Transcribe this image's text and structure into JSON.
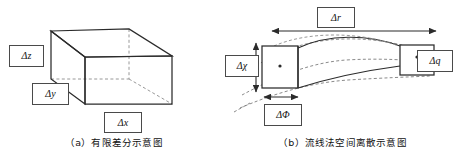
{
  "figure": {
    "panels": [
      {
        "id": "a",
        "caption": "（a）有限差分示意图",
        "diagram_type": "3d-rectangular-box",
        "labels": [
          {
            "name": "delta-z",
            "delta": "Δ",
            "symbol": "z",
            "text": "Δz"
          },
          {
            "name": "delta-y",
            "delta": "Δ",
            "symbol": "y",
            "text": "Δy"
          },
          {
            "name": "delta-x",
            "delta": "Δ",
            "symbol": "x",
            "text": "Δx"
          }
        ]
      },
      {
        "id": "b",
        "caption": "（b）流线法空间离散示意图",
        "diagram_type": "curved-streamtube-cell",
        "labels": [
          {
            "name": "delta-r",
            "delta": "Δ",
            "symbol": "r",
            "text": "Δr"
          },
          {
            "name": "delta-chi",
            "delta": "Δ",
            "symbol": "χ",
            "text": "Δχ"
          },
          {
            "name": "delta-phi",
            "delta": "Δ",
            "symbol": "Φ",
            "text": "ΔΦ"
          },
          {
            "name": "delta-q",
            "delta": "Δ",
            "symbol": "q",
            "text": "Δq"
          }
        ]
      }
    ]
  },
  "style": {
    "line_color": "#2b2b2b",
    "hidden_line_color": "#8c8c8c",
    "label_border_color": "#4a4a4a",
    "background": "#ffffff"
  }
}
